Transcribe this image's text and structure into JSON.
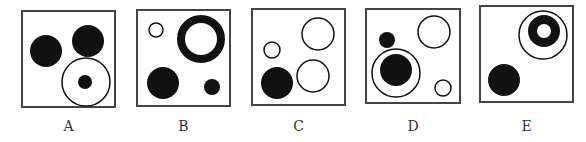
{
  "puzzle": {
    "options": [
      {
        "label": "A",
        "box": {
          "x": 22,
          "y": 11,
          "w": 93,
          "h": 96
        },
        "shapes": [
          {
            "type": "filled",
            "cx": 46,
            "cy": 51,
            "r": 16
          },
          {
            "type": "filled",
            "cx": 88,
            "cy": 41,
            "r": 16
          },
          {
            "type": "ring",
            "cx": 86,
            "cy": 82,
            "r": 24
          },
          {
            "type": "filled",
            "cx": 85,
            "cy": 82,
            "r": 7
          }
        ]
      },
      {
        "label": "B",
        "box": {
          "x": 137,
          "y": 10,
          "w": 93,
          "h": 96
        },
        "shapes": [
          {
            "type": "ring",
            "cx": 156,
            "cy": 30,
            "r": 7
          },
          {
            "type": "thick-ring",
            "cx": 201,
            "cy": 39,
            "r": 24,
            "inner_r": 16
          },
          {
            "type": "filled",
            "cx": 163,
            "cy": 83,
            "r": 16
          },
          {
            "type": "filled",
            "cx": 212,
            "cy": 87,
            "r": 8
          }
        ]
      },
      {
        "label": "C",
        "box": {
          "x": 252,
          "y": 9,
          "w": 93,
          "h": 96
        },
        "shapes": [
          {
            "type": "ring",
            "cx": 318,
            "cy": 34,
            "r": 16
          },
          {
            "type": "ring",
            "cx": 272,
            "cy": 50,
            "r": 8
          },
          {
            "type": "filled",
            "cx": 277,
            "cy": 83,
            "r": 16
          },
          {
            "type": "ring",
            "cx": 313,
            "cy": 76,
            "r": 16
          }
        ]
      },
      {
        "label": "D",
        "box": {
          "x": 366,
          "y": 9,
          "w": 94,
          "h": 94
        },
        "shapes": [
          {
            "type": "filled",
            "cx": 387,
            "cy": 40,
            "r": 8
          },
          {
            "type": "ring",
            "cx": 434,
            "cy": 32,
            "r": 16
          },
          {
            "type": "ring",
            "cx": 396,
            "cy": 73,
            "r": 24
          },
          {
            "type": "filled",
            "cx": 396,
            "cy": 70,
            "r": 16
          },
          {
            "type": "ring",
            "cx": 443,
            "cy": 88,
            "r": 8
          }
        ]
      },
      {
        "label": "E",
        "box": {
          "x": 480,
          "y": 6,
          "w": 93,
          "h": 96
        },
        "shapes": [
          {
            "type": "ring",
            "cx": 543,
            "cy": 35,
            "r": 24
          },
          {
            "type": "thick-ring",
            "cx": 544,
            "cy": 31,
            "r": 16,
            "inner_r": 7
          },
          {
            "type": "filled",
            "cx": 504,
            "cy": 80,
            "r": 16
          }
        ]
      }
    ],
    "labels_y": 118
  },
  "colors": {
    "ink": "#111111",
    "box_stroke": "#444444",
    "background": "#ffffff",
    "label": "#333333"
  }
}
